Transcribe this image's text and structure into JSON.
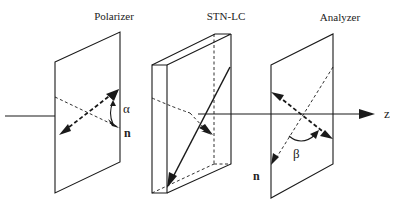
{
  "diagram": {
    "type": "optical-setup",
    "components": {
      "polarizer": {
        "label": "Polarizer",
        "angle_symbol": "α",
        "director_label": "n"
      },
      "stn_lc": {
        "label": "STN-LC"
      },
      "analyzer": {
        "label": "Analyzer",
        "angle_symbol": "β",
        "director_label": "n"
      }
    },
    "axis": {
      "label": "z"
    },
    "colors": {
      "line": "#1a1a1a",
      "background": "#ffffff"
    }
  }
}
